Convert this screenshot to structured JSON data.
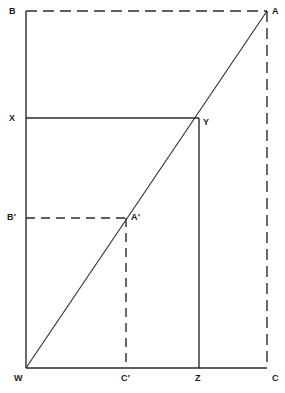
{
  "diagram": {
    "type": "geometry-figure",
    "title": "",
    "canvas": {
      "width": 285,
      "height": 393,
      "background": "#ffffff"
    },
    "stroke_color": "#2b2b2b",
    "labels": {
      "A": "A",
      "B": "B",
      "C": "C",
      "W": "W",
      "X": "X",
      "Y": "Y",
      "Z": "Z",
      "A_prime": "A′",
      "B_prime": "B′",
      "C_prime": "C′"
    },
    "points": {
      "B": {
        "x": 26,
        "y": 11
      },
      "A": {
        "x": 267,
        "y": 11
      },
      "X": {
        "x": 26,
        "y": 118
      },
      "Y": {
        "x": 199,
        "y": 118
      },
      "B_prime": {
        "x": 26,
        "y": 218
      },
      "A_prime": {
        "x": 126,
        "y": 218
      },
      "W": {
        "x": 26,
        "y": 368
      },
      "C_prime": {
        "x": 126,
        "y": 368
      },
      "Z": {
        "x": 199,
        "y": 368
      },
      "C": {
        "x": 267,
        "y": 368
      }
    },
    "segments": [
      {
        "name": "left-edge-BW",
        "from": "B",
        "to": "W",
        "style": "solid"
      },
      {
        "name": "bottom-edge-WC",
        "from": "W",
        "to": "C",
        "style": "solid"
      },
      {
        "name": "top-edge-BA",
        "from": "B",
        "to": "A",
        "style": "dashed"
      },
      {
        "name": "right-edge-AC",
        "from": "A",
        "to": "C",
        "style": "dashed"
      },
      {
        "name": "diagonal-WA",
        "from": "W",
        "to": "A",
        "style": "solid"
      },
      {
        "name": "horizontal-XY",
        "from": "X",
        "to": "Y",
        "style": "solid"
      },
      {
        "name": "vertical-YZ",
        "from": "Y",
        "to": "Z",
        "style": "solid"
      },
      {
        "name": "horizontal-Bprime-Aprime",
        "from": "B_prime",
        "to": "A_prime",
        "style": "dashed"
      },
      {
        "name": "vertical-Aprime-Cprime",
        "from": "A_prime",
        "to": "C_prime",
        "style": "dashed"
      }
    ]
  }
}
